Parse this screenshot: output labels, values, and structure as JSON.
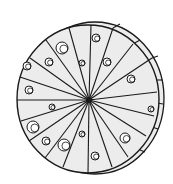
{
  "illustration": {
    "subject": "Round cheese wheel divided into wedges with holes",
    "colors": {
      "stroke": "#1a1a1a",
      "fill": "#ececec",
      "background": "#ffffff"
    },
    "face": {
      "cx": 88,
      "cy": 99,
      "rx": 71,
      "ry": 74
    },
    "rim": {
      "cx": 95,
      "cy": 98,
      "rx": 69,
      "ry": 76
    },
    "center": {
      "x": 89,
      "y": 100,
      "r": 3
    },
    "radial_ends": [
      [
        91,
        25
      ],
      [
        69,
        28
      ],
      [
        46,
        40
      ],
      [
        30,
        58
      ],
      [
        20,
        77
      ],
      [
        17,
        100
      ],
      [
        21,
        121
      ],
      [
        29,
        141
      ],
      [
        45,
        158
      ],
      [
        63,
        167
      ],
      [
        88,
        173
      ],
      [
        112,
        167
      ],
      [
        128,
        157
      ],
      [
        146,
        136
      ],
      [
        154,
        116
      ],
      [
        157,
        92
      ],
      [
        152,
        58
      ],
      [
        133,
        44
      ],
      [
        113,
        28
      ]
    ],
    "rim_segments": [
      [
        [
          113,
          28
        ],
        [
          120,
          24
        ]
      ],
      [
        [
          133,
          44
        ],
        [
          140,
          40
        ]
      ],
      [
        [
          152,
          58
        ],
        [
          158,
          56
        ]
      ],
      [
        [
          157,
          80
        ],
        [
          163,
          80
        ]
      ],
      [
        [
          157,
          103
        ],
        [
          163,
          104
        ]
      ],
      [
        [
          152,
          127
        ],
        [
          158,
          129
        ]
      ],
      [
        [
          140,
          150
        ],
        [
          145,
          152
        ]
      ]
    ],
    "holes": [
      {
        "x": 62,
        "y": 48,
        "r": 6
      },
      {
        "x": 49,
        "y": 62,
        "r": 4
      },
      {
        "x": 27,
        "y": 66,
        "r": 4
      },
      {
        "x": 29,
        "y": 90,
        "r": 4
      },
      {
        "x": 82,
        "y": 63,
        "r": 3
      },
      {
        "x": 52,
        "y": 107,
        "r": 3
      },
      {
        "x": 33,
        "y": 127,
        "r": 6
      },
      {
        "x": 46,
        "y": 141,
        "r": 4
      },
      {
        "x": 64,
        "y": 145,
        "r": 6
      },
      {
        "x": 82,
        "y": 134,
        "r": 3
      },
      {
        "x": 96,
        "y": 38,
        "r": 4
      },
      {
        "x": 107,
        "y": 62,
        "r": 4
      },
      {
        "x": 131,
        "y": 79,
        "r": 4
      },
      {
        "x": 151,
        "y": 109,
        "r": 3
      },
      {
        "x": 125,
        "y": 138,
        "r": 5
      },
      {
        "x": 95,
        "y": 156,
        "r": 4
      }
    ]
  }
}
